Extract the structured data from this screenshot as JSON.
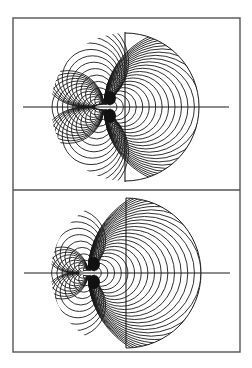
{
  "figure": {
    "width": 252,
    "height": 368,
    "frame": {
      "x": 13,
      "y": 18,
      "w": 227,
      "h": 334,
      "divider_y": 190
    },
    "line_color": "#1a1a1a",
    "frame_color": "#555555",
    "panels": [
      {
        "id": "top",
        "center": {
          "x": 125,
          "y": 107
        },
        "radius": 74,
        "source": {
          "x": 104,
          "y": 107
        },
        "h_axis": {
          "x1": 23,
          "x2": 229
        },
        "v_axis": {
          "y1": 32,
          "y2": 182
        },
        "right_circles": 24,
        "lobe_circles": 14,
        "left_cut_x": 52
      },
      {
        "id": "bottom",
        "center": {
          "x": 126,
          "y": 273
        },
        "radius": 75,
        "source": {
          "x": 88,
          "y": 273
        },
        "h_axis": {
          "x1": 24,
          "x2": 230
        },
        "v_axis": {
          "y1": 198,
          "y2": 348
        },
        "right_circles": 26,
        "lobe_circles": 10,
        "left_cut_x": 55
      }
    ]
  }
}
